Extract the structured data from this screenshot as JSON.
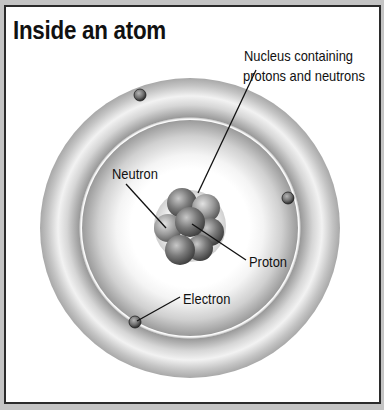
{
  "title": "Inside an atom",
  "labels": {
    "nucleus_line1": "Nucleus containing",
    "nucleus_line2": "protons and neutrons",
    "neutron": "Neutron",
    "proton": "Proton",
    "electron": "Electron"
  },
  "colors": {
    "frame_outer": "#c4c4c4",
    "frame_border": "#2b2b2b",
    "background": "#ffffff",
    "shell_dark": "#8a8a8a",
    "text": "#111111"
  },
  "atom": {
    "shells": 2,
    "electrons_visible": 3,
    "nucleons_visible": 8
  }
}
